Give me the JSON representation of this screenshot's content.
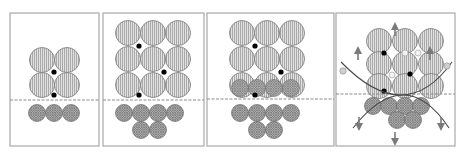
{
  "figure": {
    "colors": {
      "frame": "#a8a8a8",
      "large_grain_fill": "#d9d9d9",
      "large_grain_hatch": "#9a9a9a",
      "small_grain_fill": "#a0a0a0",
      "junction_dot": "#000000",
      "curve": "#4a4a4a",
      "arrow": "#7a7a7a"
    },
    "panels": [
      {
        "id": "panel-1",
        "frame": {
          "x": 10,
          "y": 13,
          "w": 89,
          "h": 133
        },
        "interface_y": 100,
        "large_grains": [
          [
            42,
            60
          ],
          [
            67,
            60
          ],
          [
            42,
            85
          ],
          [
            67,
            85
          ]
        ],
        "large_r": 12.5,
        "small_grains": [
          [
            37,
            113
          ],
          [
            54,
            113
          ],
          [
            71,
            113
          ]
        ],
        "small_r": 8.5,
        "dots": [
          [
            54,
            72
          ],
          [
            54,
            95
          ]
        ],
        "arcs": [],
        "arrows_up": [],
        "arrows_down": [],
        "side_markers": []
      },
      {
        "id": "panel-2",
        "frame": {
          "x": 103,
          "y": 13,
          "w": 101,
          "h": 133
        },
        "interface_y": 100,
        "large_grains": [
          [
            128,
            33
          ],
          [
            153,
            33
          ],
          [
            178,
            33
          ],
          [
            128,
            59
          ],
          [
            153,
            59
          ],
          [
            178,
            59
          ],
          [
            128,
            85
          ],
          [
            153,
            85
          ],
          [
            178,
            85
          ]
        ],
        "large_r": 12.5,
        "small_grains": [
          [
            124,
            113
          ],
          [
            141,
            113
          ],
          [
            158,
            113
          ],
          [
            175,
            113
          ],
          [
            141,
            130
          ],
          [
            158,
            130
          ]
        ],
        "small_r": 8.5,
        "dots": [
          [
            139,
            46
          ],
          [
            164,
            72
          ],
          [
            139,
            95
          ]
        ],
        "arcs": [],
        "arrows_up": [],
        "arrows_down": [],
        "side_markers": []
      },
      {
        "id": "panel-3",
        "frame": {
          "x": 207,
          "y": 13,
          "w": 127,
          "h": 133
        },
        "interface_y": 99,
        "large_grains": [
          [
            242,
            33
          ],
          [
            267,
            33
          ],
          [
            292,
            33
          ],
          [
            242,
            59
          ],
          [
            267,
            59
          ],
          [
            292,
            59
          ],
          [
            242,
            85
          ],
          [
            267,
            85
          ],
          [
            292,
            85
          ]
        ],
        "large_r": 12.5,
        "overlap_small_grains": [
          [
            240,
            88
          ],
          [
            257,
            88
          ],
          [
            274,
            88
          ],
          [
            291,
            88
          ]
        ],
        "small_grains": [
          [
            240,
            113
          ],
          [
            257,
            113
          ],
          [
            274,
            113
          ],
          [
            291,
            113
          ],
          [
            257,
            130
          ],
          [
            274,
            130
          ]
        ],
        "small_r": 8.5,
        "dots": [
          [
            255,
            46
          ],
          [
            281,
            72
          ],
          [
            255,
            95
          ]
        ],
        "arcs": [],
        "arrows_up": [],
        "arrows_down": [],
        "side_markers": []
      },
      {
        "id": "panel-4",
        "frame": {
          "x": 336,
          "y": 13,
          "w": 119,
          "h": 133
        },
        "interface_y": 94,
        "large_grains": [
          [
            392,
            41
          ],
          [
            405,
            41
          ],
          [
            418,
            41
          ],
          [
            392,
            64
          ],
          [
            405,
            64
          ],
          [
            418,
            64
          ],
          [
            392,
            86
          ],
          [
            405,
            86
          ],
          [
            418,
            86
          ]
        ],
        "large_grains_spaced": [
          [
            379,
            41
          ],
          [
            405,
            41
          ],
          [
            431,
            41
          ],
          [
            379,
            64
          ],
          [
            405,
            64
          ],
          [
            431,
            64
          ],
          [
            379,
            86
          ],
          [
            405,
            86
          ],
          [
            431,
            86
          ]
        ],
        "large_r": 12.5,
        "small_grains": [
          [
            373,
            106
          ],
          [
            389,
            106
          ],
          [
            405,
            106
          ],
          [
            421,
            106
          ],
          [
            397,
            120
          ],
          [
            413,
            120
          ]
        ],
        "small_r": 8.5,
        "dots": [
          [
            384,
            53
          ],
          [
            410,
            74
          ],
          [
            384,
            91
          ]
        ],
        "hollow_dots": [
          [
            405,
            53
          ],
          [
            392,
            75
          ],
          [
            418,
            53
          ]
        ],
        "arcs": [
          "upper-concave",
          "lower-convex"
        ],
        "arrows_up": [
          [
            395,
            26
          ],
          [
            358,
            50
          ],
          [
            430,
            50
          ]
        ],
        "arrows_down": [
          [
            359,
            117
          ],
          [
            441,
            117
          ],
          [
            395,
            132
          ]
        ],
        "side_markers": [
          [
            343,
            71
          ],
          [
            447,
            66
          ]
        ]
      }
    ]
  }
}
